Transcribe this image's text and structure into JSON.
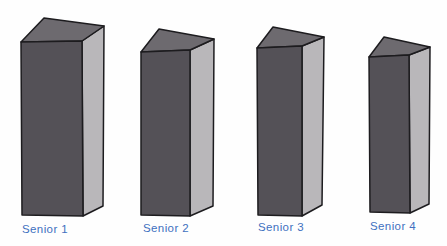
{
  "figure": {
    "background_color": "#fefefe",
    "outline_color": "#1d1c1f",
    "front_color": "#545157",
    "top_color": "#6d6a6f",
    "side_color": "#b9b7ba",
    "label_color": "#4170c0",
    "label_font_size": 11.5
  },
  "chart_data": {
    "type": "bar",
    "style": "3d-block-pictogram",
    "title": "",
    "xlabel": "",
    "ylabel": "",
    "categories": [
      "Senior 1",
      "Senior 2",
      "Senior 3",
      "Senior 4"
    ],
    "values": [
      174,
      164,
      169,
      157
    ],
    "values_unit": "relative bar heights in px (figure shows no numeric axis)",
    "axes_shown": false,
    "grid": false,
    "legend": false
  },
  "bars": [
    {
      "label": "Senior 1",
      "front": [
        [
          21,
          42
        ],
        [
          82,
          41
        ],
        [
          83,
          216
        ],
        [
          22,
          215
        ]
      ],
      "top": [
        [
          21,
          42
        ],
        [
          44,
          18
        ],
        [
          104,
          26
        ],
        [
          82,
          41
        ]
      ],
      "side": [
        [
          82,
          41
        ],
        [
          104,
          26
        ],
        [
          103,
          206
        ],
        [
          83,
          216
        ]
      ],
      "label_x": 22,
      "label_y": 233
    },
    {
      "label": "Senior 2",
      "front": [
        [
          141,
          52
        ],
        [
          190,
          50
        ],
        [
          190,
          216
        ],
        [
          141,
          215
        ]
      ],
      "top": [
        [
          141,
          52
        ],
        [
          159,
          29
        ],
        [
          214,
          39
        ],
        [
          190,
          50
        ]
      ],
      "side": [
        [
          190,
          50
        ],
        [
          214,
          39
        ],
        [
          213,
          206
        ],
        [
          190,
          216
        ]
      ],
      "label_x": 143,
      "label_y": 232
    },
    {
      "label": "Senior 3",
      "front": [
        [
          257,
          48
        ],
        [
          302,
          46
        ],
        [
          302,
          216
        ],
        [
          258,
          215
        ]
      ],
      "top": [
        [
          257,
          48
        ],
        [
          273,
          27
        ],
        [
          324,
          37
        ],
        [
          302,
          46
        ]
      ],
      "side": [
        [
          302,
          46
        ],
        [
          324,
          37
        ],
        [
          322,
          205
        ],
        [
          302,
          216
        ]
      ],
      "label_x": 258,
      "label_y": 231
    },
    {
      "label": "Senior 4",
      "front": [
        [
          369,
          57
        ],
        [
          409,
          55
        ],
        [
          410,
          213
        ],
        [
          370,
          212
        ]
      ],
      "top": [
        [
          369,
          57
        ],
        [
          384,
          37
        ],
        [
          430,
          47
        ],
        [
          409,
          55
        ]
      ],
      "side": [
        [
          409,
          55
        ],
        [
          430,
          47
        ],
        [
          429,
          204
        ],
        [
          410,
          213
        ]
      ],
      "label_x": 370,
      "label_y": 230
    }
  ]
}
